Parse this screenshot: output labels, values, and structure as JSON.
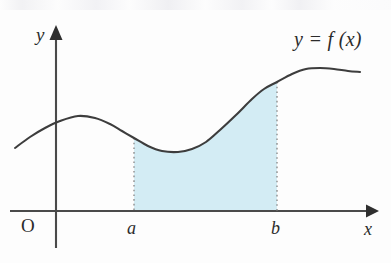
{
  "figure": {
    "type": "math-diagram",
    "width": 391,
    "height": 263,
    "background_color": "#fdfdfd"
  },
  "labels": {
    "y_axis": "y",
    "x_axis": "x",
    "origin": "O",
    "lower_limit": "a",
    "upper_limit": "b",
    "function": "y = f (x)"
  },
  "colors": {
    "axis": "#4a4a4a",
    "curve": "#3d3d3d",
    "shaded_region": "#d3ecf4",
    "dotted_line": "#8d8d8d",
    "text": "#2b2b2b"
  },
  "chart_data": {
    "type": "line",
    "title": "",
    "xlabel": "x",
    "ylabel": "y",
    "legend": [
      "y = f (x)"
    ],
    "grid": false,
    "annotations": [
      {
        "text": "y = f (x)",
        "x": 336,
        "y": 42,
        "role": "curve-label"
      },
      {
        "text": "a",
        "x": 134,
        "y": 230,
        "role": "x-tick-lower-limit"
      },
      {
        "text": "b",
        "x": 277,
        "y": 230,
        "role": "x-tick-upper-limit"
      },
      {
        "text": "O",
        "x": 29,
        "y": 228,
        "role": "origin-label"
      }
    ],
    "axes": {
      "x_axis_y_px": 211,
      "y_axis_x_px": 56,
      "x_axis_start_px": 10,
      "x_axis_end_px": 379,
      "y_axis_top_px": 25,
      "y_axis_bottom_px": 248
    },
    "curve_points_px": [
      [
        15,
        148
      ],
      [
        30,
        137
      ],
      [
        45,
        128
      ],
      [
        60,
        121
      ],
      [
        78,
        116
      ],
      [
        95,
        118
      ],
      [
        110,
        124
      ],
      [
        122,
        131
      ],
      [
        134,
        138
      ],
      [
        148,
        146
      ],
      [
        162,
        151
      ],
      [
        178,
        152
      ],
      [
        192,
        149
      ],
      [
        206,
        142
      ],
      [
        220,
        130
      ],
      [
        236,
        115
      ],
      [
        252,
        99
      ],
      [
        264,
        89
      ],
      [
        277,
        82
      ],
      [
        292,
        74
      ],
      [
        306,
        69
      ],
      [
        320,
        68
      ],
      [
        334,
        69
      ],
      [
        348,
        71
      ],
      [
        360,
        72
      ]
    ],
    "shaded_region": {
      "fill": "#d3ecf4",
      "x_from_label": "a",
      "x_to_label": "b",
      "x_from_px": 134,
      "x_to_px": 277,
      "baseline_y_px": 211,
      "curve_y_at_a_px": 138,
      "curve_y_at_b_px": 82
    },
    "dotted_verticals": [
      {
        "label": "a",
        "x_px": 134,
        "y_top_px": 138,
        "y_bottom_px": 211
      },
      {
        "label": "b",
        "x_px": 277,
        "y_top_px": 82,
        "y_bottom_px": 211
      }
    ]
  }
}
